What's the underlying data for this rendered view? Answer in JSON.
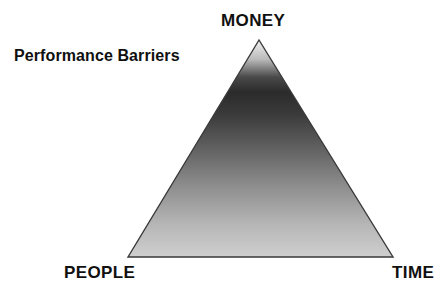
{
  "diagram": {
    "type": "triangle-constraint-diagram",
    "caption": "Performance Barriers",
    "background_color": "#ffffff",
    "text_color": "#101010",
    "vertices": [
      {
        "id": "apex",
        "label": "MONEY",
        "x": 259,
        "y": 40
      },
      {
        "id": "bottom-left",
        "label": "PEOPLE",
        "x": 128,
        "y": 257
      },
      {
        "id": "bottom-right",
        "label": "TIME",
        "x": 393,
        "y": 257
      }
    ],
    "fill": {
      "style": "vertical-gradient",
      "stops": [
        {
          "offset": "0%",
          "color": "#f2f2f2"
        },
        {
          "offset": "9%",
          "color": "#b9b9b9"
        },
        {
          "offset": "17%",
          "color": "#4a4a4a"
        },
        {
          "offset": "24%",
          "color": "#2b2b2b"
        },
        {
          "offset": "34%",
          "color": "#3a3a3a"
        },
        {
          "offset": "50%",
          "color": "#616161"
        },
        {
          "offset": "68%",
          "color": "#8f8f8f"
        },
        {
          "offset": "85%",
          "color": "#b6b6b6"
        },
        {
          "offset": "100%",
          "color": "#cfcfcf"
        }
      ]
    },
    "outline": {
      "color": "#3a3a3a",
      "width": 1.4
    }
  }
}
